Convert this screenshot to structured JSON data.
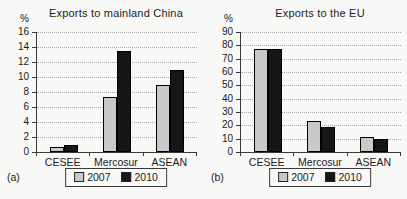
{
  "figure": {
    "background": "#f8f8f6",
    "text_color": "#1c1c1c",
    "grid_color": "#a9a9a9",
    "axis_color": "#3a3a3a",
    "bar_2007_color": "#c9c9c9",
    "bar_2010_color": "#161616"
  },
  "chart_data": [
    {
      "type": "bar",
      "panel_label": "(a)",
      "title": "Exports to mainland China",
      "ylabel": "%",
      "categories": [
        "CESEE",
        "Mercosur",
        "ASEAN"
      ],
      "series": [
        {
          "name": "2007",
          "color": "#c9c9c9",
          "values": [
            0.7,
            7.4,
            9.0
          ]
        },
        {
          "name": "2010",
          "color": "#161616",
          "values": [
            1.0,
            13.5,
            11.0
          ]
        }
      ],
      "ylim": [
        0,
        16
      ],
      "ytick_step": 2,
      "grid": "dotted-horizontal",
      "legend_position": "bottom"
    },
    {
      "type": "bar",
      "panel_label": "(b)",
      "title": "Exports to the EU",
      "ylabel": "%",
      "categories": [
        "CESEE",
        "Mercosur",
        "ASEAN"
      ],
      "series": [
        {
          "name": "2007",
          "color": "#c9c9c9",
          "values": [
            77,
            23,
            11
          ]
        },
        {
          "name": "2010",
          "color": "#161616",
          "values": [
            77,
            19,
            9.5
          ]
        }
      ],
      "ylim": [
        0,
        90
      ],
      "ytick_step": 10,
      "grid": "dotted-horizontal",
      "legend_position": "bottom"
    }
  ]
}
